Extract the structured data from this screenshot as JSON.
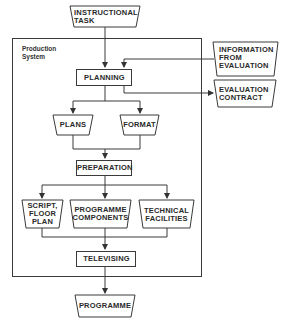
{
  "diagram": {
    "boundary_label": "Production\nSystem",
    "nodes": {
      "instructional_task": "INSTRUCTIONAL\nTASK",
      "information_from_evaluation": "INFORMATION\nFROM\nEVALUATION",
      "planning": "PLANNING",
      "evaluation_contract": "EVALUATION\nCONTRACT",
      "plans": "PLANS",
      "format": "FORMAT",
      "preparation": "PREPARATION",
      "script_floor_plan": "SCRIPT,\nFLOOR\nPLAN",
      "programme_components": "PROGRAMME\nCOMPONENTS",
      "technical_facilities": "TECHNICAL\nFACILITIES",
      "televising": "TELEVISING",
      "programme": "PROGRAMME"
    },
    "edges": [
      {
        "from": "instructional_task",
        "to": "planning"
      },
      {
        "from": "information_from_evaluation",
        "to": "planning"
      },
      {
        "from": "planning",
        "to": "evaluation_contract"
      },
      {
        "from": "planning",
        "to": "plans"
      },
      {
        "from": "planning",
        "to": "format"
      },
      {
        "from": "plans",
        "to": "preparation"
      },
      {
        "from": "format",
        "to": "preparation"
      },
      {
        "from": "preparation",
        "to": "script_floor_plan"
      },
      {
        "from": "preparation",
        "to": "programme_components"
      },
      {
        "from": "preparation",
        "to": "technical_facilities"
      },
      {
        "from": "script_floor_plan",
        "to": "televising"
      },
      {
        "from": "programme_components",
        "to": "televising"
      },
      {
        "from": "technical_facilities",
        "to": "televising"
      },
      {
        "from": "televising",
        "to": "programme"
      }
    ],
    "colors": {
      "line": "#3a3a3a",
      "background": "#ffffff"
    }
  }
}
